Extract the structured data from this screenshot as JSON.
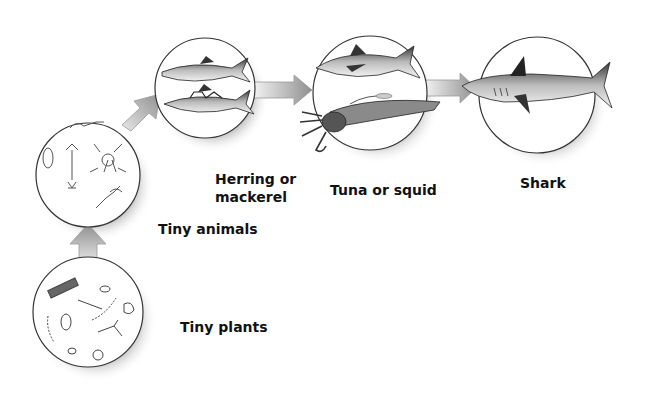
{
  "diagram": {
    "type": "food-chain",
    "direction": "bottom-left to right",
    "nodes": [
      {
        "id": "tiny-plants",
        "label": "Tiny plants"
      },
      {
        "id": "tiny-animals",
        "label": "Tiny animals"
      },
      {
        "id": "herring",
        "label": "Herring or\nmackerel"
      },
      {
        "id": "tuna",
        "label": "Tuna or squid"
      },
      {
        "id": "shark",
        "label": "Shark"
      }
    ],
    "edges": [
      {
        "from": "tiny-plants",
        "to": "tiny-animals"
      },
      {
        "from": "tiny-animals",
        "to": "herring"
      },
      {
        "from": "herring",
        "to": "tuna"
      },
      {
        "from": "tuna",
        "to": "shark"
      }
    ],
    "colors": {
      "arrow_light": "#eeeeee",
      "arrow_dark": "#9a9a9a",
      "circle_stroke": "#333333",
      "shadow": "#bdbdbd",
      "text": "#111111"
    }
  }
}
